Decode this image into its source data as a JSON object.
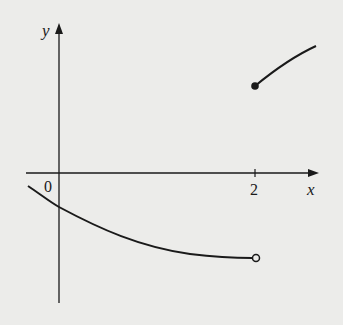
{
  "figure": {
    "axes": {
      "x_label": "x",
      "y_label": "y",
      "origin_label": "0",
      "x_tick_labels": [
        "2"
      ]
    },
    "pieces": [
      {
        "name": "left-branch",
        "domain": "x < 2",
        "shape": "decreasing concave-up curve",
        "endpoint": "open circle at x=2"
      },
      {
        "name": "right-branch",
        "domain": "x >= 2",
        "shape": "increasing concave-down curve",
        "endpoint": "filled dot at x=2"
      }
    ],
    "colors": {
      "background": "#ececea",
      "ink": "#1a1a1a"
    }
  }
}
